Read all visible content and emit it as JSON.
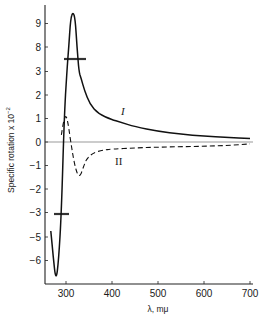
{
  "chart_data": {
    "type": "line",
    "title": "",
    "xlabel": "λ, mμ",
    "ylabel": "Specific rotation x 10⁻²",
    "xlim": [
      254,
      700
    ],
    "x_ticks": [
      300,
      400,
      500,
      600,
      700
    ],
    "y_ticks": [
      9,
      8,
      3,
      2,
      1,
      0,
      -1,
      -2,
      -3,
      -5,
      -6
    ],
    "y_axis_breaks": [
      [
        3,
        8
      ],
      [
        -5,
        -3
      ]
    ],
    "grid": false,
    "legend": "inline labels",
    "zero_line": true,
    "series": [
      {
        "name": "I",
        "style": "solid",
        "x": [
          267,
          272,
          278,
          284,
          290,
          296,
          302,
          306,
          310,
          315,
          320,
          324,
          328,
          333,
          340,
          352,
          370,
          400,
          417,
          450,
          500,
          550,
          600,
          650,
          700
        ],
        "y": [
          -4.5,
          -5.8,
          -6.9,
          -6.0,
          -3.0,
          1.0,
          3.0,
          8.0,
          9.2,
          9.5,
          9.2,
          8.0,
          3.0,
          2.7,
          2.2,
          1.6,
          1.2,
          0.95,
          0.85,
          0.65,
          0.45,
          0.33,
          0.25,
          0.2,
          0.15
        ]
      },
      {
        "name": "II",
        "style": "dashed",
        "x": [
          290,
          294,
          298,
          302,
          306,
          312,
          318,
          325,
          331,
          338,
          345,
          360,
          380,
          400,
          450,
          500,
          550,
          600,
          650,
          700
        ],
        "y": [
          0.3,
          0.8,
          1.1,
          1.05,
          0.6,
          -0.2,
          -0.9,
          -1.4,
          -1.45,
          -1.05,
          -0.7,
          -0.45,
          -0.35,
          -0.3,
          -0.25,
          -0.22,
          -0.2,
          -0.18,
          -0.15,
          -0.08
        ]
      }
    ],
    "annotations": [
      {
        "text": "I",
        "x": 425,
        "y": 1.1
      },
      {
        "text": "II",
        "x": 415,
        "y": -0.85
      }
    ]
  },
  "labels": {
    "ylabel": "Specific rotation x 10",
    "ylabel_exp": "−2",
    "xlabel": "λ, mμ",
    "curve_I": "I",
    "curve_II": "II"
  }
}
